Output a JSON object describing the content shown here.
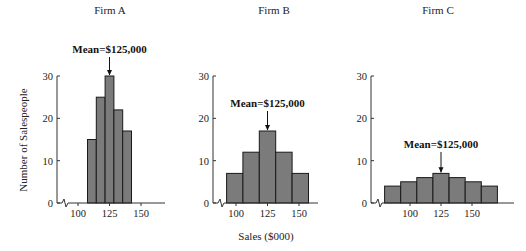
{
  "chart_data": [
    {
      "type": "bar",
      "title": "Firm A",
      "xlabel": "Sales ($000)",
      "ylabel": "Number of Salespeople",
      "ylim": [
        0,
        30
      ],
      "yticks": [
        0,
        10,
        20,
        30
      ],
      "xticks": [
        100,
        125,
        150
      ],
      "annotation": "Mean = $125,000",
      "bin_width": 7,
      "bin_centers": [
        111,
        118,
        125,
        132,
        139
      ],
      "values": [
        15,
        25,
        30,
        22,
        17
      ]
    },
    {
      "type": "bar",
      "title": "Firm B",
      "xlabel": "Sales ($000)",
      "ylabel": "Number of Salespeople",
      "ylim": [
        0,
        30
      ],
      "yticks": [
        0,
        10,
        20,
        30
      ],
      "xticks": [
        100,
        125,
        150
      ],
      "annotation": "Mean = $125,000",
      "bin_width": 13,
      "bin_centers": [
        99,
        112,
        125,
        138,
        151
      ],
      "values": [
        7,
        12,
        17,
        12,
        7
      ]
    },
    {
      "type": "bar",
      "title": "Firm C",
      "xlabel": "Sales ($000)",
      "ylabel": "Number of Salespeople",
      "ylim": [
        0,
        30
      ],
      "yticks": [
        0,
        10,
        20,
        30
      ],
      "xticks": [
        100,
        125,
        150
      ],
      "annotation": "Mean = $125,000",
      "bin_width": 13,
      "bin_centers": [
        86,
        99,
        112,
        125,
        138,
        151,
        164
      ],
      "values": [
        4,
        5,
        6,
        7,
        6,
        5,
        4
      ]
    }
  ],
  "labels": {
    "ylabel": "Number of Salespeople",
    "xlabel": "Sales ($000)",
    "mean": "Mean = $125,000",
    "firmA": "Firm A",
    "firmB": "Firm B",
    "firmC": "Firm C"
  },
  "colors": {
    "bar_fill": "#7b7b7b",
    "bar_stroke": "#1a1a1a",
    "axis": "#333333"
  }
}
